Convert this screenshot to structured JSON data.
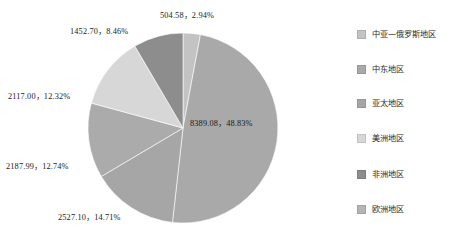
{
  "chart_data": {
    "type": "pie",
    "title": "",
    "legend_position": "right",
    "start_angle_deg": 0,
    "direction": "clockwise",
    "total": 17178.45,
    "categories": [
      "中亚—俄罗斯地区",
      "中东地区",
      "亚太地区",
      "美洲地区",
      "非洲地区",
      "欧洲地区"
    ],
    "values": [
      504.58,
      8389.08,
      2527.1,
      2187.99,
      2117.0,
      1452.7
    ],
    "percents": [
      2.94,
      48.83,
      14.71,
      12.74,
      12.32,
      8.46
    ],
    "colors": [
      "#c3c3c3",
      "#a9a9a9",
      "#a6a6a6",
      "#ababab",
      "#d7d7d7",
      "#8d8d8d"
    ],
    "slices": [
      {
        "name": "中亚—俄罗斯地区",
        "value": 504.58,
        "percent": 2.94,
        "color": "#c3c3c3",
        "label": "504.58，2.94%",
        "label_x": 160,
        "label_y": 8,
        "label_inside": false
      },
      {
        "name": "中东地区",
        "value": 8389.08,
        "percent": 48.83,
        "color": "#a9a9a9",
        "label": "8389.08，48.83%",
        "label_x": 190,
        "label_y": 116,
        "label_inside": true
      },
      {
        "name": "亚太地区",
        "value": 2527.1,
        "percent": 14.71,
        "color": "#a6a6a6",
        "label": "2527.10，14.71%",
        "label_x": 58,
        "label_y": 210,
        "label_inside": false
      },
      {
        "name": "美洲地区",
        "value": 2187.99,
        "percent": 12.74,
        "color": "#ababab",
        "label": "2187.99，12.74%",
        "label_x": 6,
        "label_y": 159,
        "label_inside": false
      },
      {
        "name": "非洲地区",
        "value": 2117.0,
        "percent": 12.32,
        "color": "#d7d7d7",
        "label": "2117.00，12.32%",
        "label_x": 8,
        "label_y": 89,
        "label_inside": false
      },
      {
        "name": "欧洲地区",
        "value": 1452.7,
        "percent": 8.46,
        "color": "#8d8d8d",
        "label": "1452.70，8.46%",
        "label_x": 70,
        "label_y": 24,
        "label_inside": false
      }
    ],
    "geometry": {
      "center_x": 183,
      "center_y": 128,
      "radius": 95
    }
  },
  "legend": {
    "items": [
      {
        "label": "中亚—俄罗斯地区",
        "color": "#c3c3c3",
        "y": 28
      },
      {
        "label": "中东地区",
        "color": "#a9a9a9",
        "y": 63
      },
      {
        "label": "亚太地区",
        "color": "#a6a6a6",
        "y": 97
      },
      {
        "label": "美洲地区",
        "color": "#d7d7d7",
        "y": 132
      },
      {
        "label": "非洲地区",
        "color": "#8d8d8d",
        "y": 168
      },
      {
        "label": "欧洲地区",
        "color": "#b5b5b5",
        "y": 203
      }
    ]
  }
}
